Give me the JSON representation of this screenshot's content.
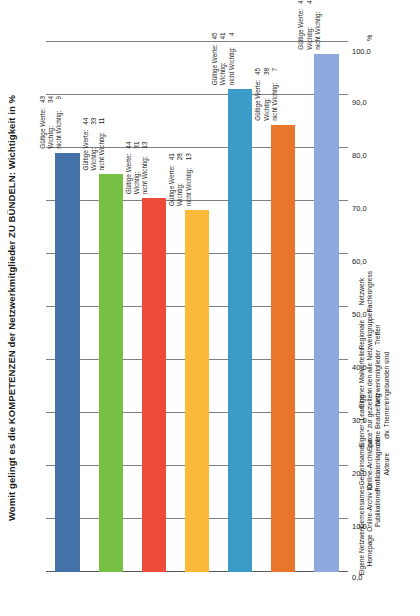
{
  "chart_data": {
    "type": "bar",
    "orientation": "horizontal-rotated",
    "title": "Womit gelingt es die KOMPETENZEN der Netzwerkmitglieder ZU BÜNDELN: Wichtigkeit in %",
    "xlabel": "",
    "ylabel": "%",
    "ylim": [
      0,
      100
    ],
    "axis_unit": "%",
    "grid": true,
    "legend": "none",
    "tick_labels": [
      "100,0",
      "90,0",
      "80,0",
      "70,0",
      "60,0",
      "50,0",
      "40,0",
      "30,0",
      "20,0",
      "10,0",
      "0,0"
    ],
    "tick_values": [
      100,
      90,
      80,
      70,
      60,
      50,
      40,
      30,
      20,
      10,
      0
    ],
    "categories": [
      "Eigene Netzwerk Homepage",
      "Gemeinsames Online-Archiv für Publikationen",
      "Gemeinsames Online-Archiv zur Profildatenlage der Akteure",
      "Eigener „Learning Space“ zur gezielten online Bearbeitung div. Themen",
      "Eigener Mailverteiler in den alle Netzwerkmitglieder eingebunden sind",
      "Regionale Netzwerkgruppen Treffen",
      "Netzwerk Fachkongress"
    ],
    "values": [
      79.1,
      75.0,
      70.5,
      68.3,
      91.1,
      84.4,
      97.8
    ],
    "colors": [
      "#4472a8",
      "#77c043",
      "#ee4b3c",
      "#fbb93a",
      "#3c9bc7",
      "#e8772c",
      "#8da9dd"
    ],
    "annotation_labels": [
      "Gültige Werte:",
      "Wichtig:",
      "nicht Wichtig:"
    ],
    "annotations": [
      {
        "gueltige_werte": 43,
        "wichtig": 34,
        "nicht_wichtig": 9
      },
      {
        "gueltige_werte": 44,
        "wichtig": 33,
        "nicht_wichtig": 11
      },
      {
        "gueltige_werte": 44,
        "wichtig": 31,
        "nicht_wichtig": 13
      },
      {
        "gueltige_werte": 41,
        "wichtig": 28,
        "nicht_wichtig": 13
      },
      {
        "gueltige_werte": 45,
        "wichtig": 41,
        "nicht_wichtig": 4
      },
      {
        "gueltige_werte": 45,
        "wichtig": 38,
        "nicht_wichtig": 7
      },
      {
        "gueltige_werte": 45,
        "wichtig": 44,
        "nicht_wichtig": 1
      }
    ]
  }
}
